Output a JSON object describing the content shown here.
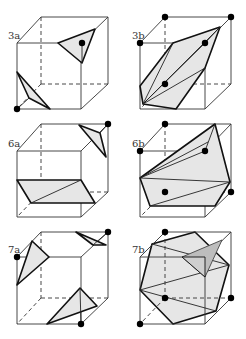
{
  "figure": {
    "panels": [
      {
        "id": "3a",
        "label": "3a"
      },
      {
        "id": "3b",
        "label": "3b"
      },
      {
        "id": "6a",
        "label": "6a"
      },
      {
        "id": "6b",
        "label": "6b"
      },
      {
        "id": "7a",
        "label": "7a"
      },
      {
        "id": "7b",
        "label": "7b"
      }
    ],
    "colors": {
      "edge": "#333333",
      "polygon_fill": "#e6e6e6",
      "polygon_stroke": "#111111",
      "vertex_dot": "#000000",
      "shaded_triangle": "#bdbdbd"
    }
  }
}
